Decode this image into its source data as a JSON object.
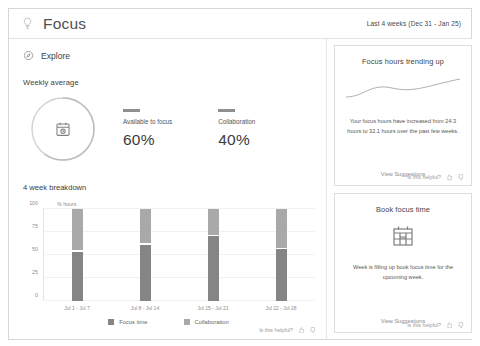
{
  "header": {
    "title": "Focus",
    "bulb_icon": "lightbulb-icon",
    "date_range": "Last 4 weeks (Dec 31 - Jan 25)"
  },
  "nav": {
    "explore_label": "Explore",
    "explore_icon": "compass-icon"
  },
  "weekly_average": {
    "section_title": "Weekly average",
    "donut_icon": "meeting-clock-icon",
    "donut_focus_pct": 60,
    "donut_collab_pct": 40,
    "metrics": [
      {
        "label": "Available to focus",
        "value": "60%"
      },
      {
        "label": "Collaboration",
        "value": "40%"
      }
    ]
  },
  "breakdown": {
    "title": "4 week breakdown",
    "axis_unit": "% hours",
    "legend": [
      {
        "label": "Focus time",
        "color": "#858585"
      },
      {
        "label": "Collaboration",
        "color": "#a9a9a9"
      }
    ],
    "feedback_label": "Is this helpful?",
    "thumb_up_icon": "thumbs-up-icon",
    "thumb_down_icon": "thumbs-down-icon"
  },
  "chart_data": {
    "type": "bar",
    "title": "4 week breakdown",
    "xlabel": "",
    "ylabel": "% hours",
    "ylim": [
      0,
      100
    ],
    "yticks": [
      0,
      25,
      50,
      75,
      100
    ],
    "grid": true,
    "stacked": true,
    "legend_position": "bottom",
    "categories": [
      "Jul 1 - Jul 7",
      "Jul 8 - Jul 14",
      "Jul 15 - Jul 21",
      "Jul 22 - Jul 28"
    ],
    "series": [
      {
        "name": "Focus time",
        "color": "#858585",
        "values": [
          55,
          63,
          72,
          58
        ]
      },
      {
        "name": "Collaboration",
        "color": "#a9a9a9",
        "values": [
          45,
          37,
          28,
          42
        ]
      }
    ]
  },
  "cards": [
    {
      "title": "Focus hours trending up",
      "art": "sparkline-curve",
      "body": "Your focus hours have increased from 24.3 hours to 32.1 hours over the past few weeks.",
      "link": "View Suggestions",
      "feedback_label": "Is this helpful?",
      "thumb_up_icon": "thumbs-up-icon",
      "thumb_down_icon": "thumbs-down-icon"
    },
    {
      "title": "Book focus time",
      "art": "calendar-icon",
      "body": "Week is filling up book focus time for the upcoming week.",
      "link": "View Suggestions",
      "feedback_label": "Is this helpful?",
      "thumb_up_icon": "thumbs-up-icon",
      "thumb_down_icon": "thumbs-down-icon"
    }
  ]
}
